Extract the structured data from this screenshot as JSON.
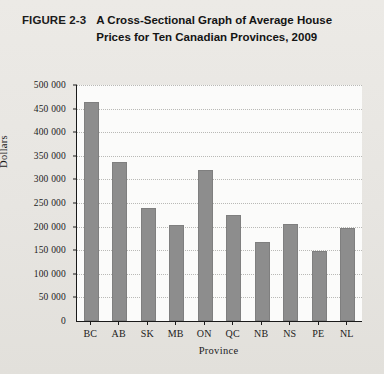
{
  "figure": {
    "label": "FIGURE 2-3",
    "title": "A Cross-Sectional Graph of Average House Prices for Ten Canadian Provinces, 2009"
  },
  "colors": {
    "bar_fill": "#8d8d8d",
    "axis_line": "#1a1a1a",
    "gridline": "#b9b9b6",
    "plot_background": "#fbfbfa",
    "page_background": "#e8e6e2"
  },
  "chart_data": {
    "type": "bar",
    "title": "A Cross-Sectional Graph of Average House Prices for Ten Canadian Provinces, 2009",
    "xlabel": "Province",
    "ylabel": "Dollars",
    "categories": [
      "BC",
      "AB",
      "SK",
      "MB",
      "ON",
      "QC",
      "NB",
      "NS",
      "PE",
      "NL"
    ],
    "values": [
      465000,
      337000,
      240000,
      203000,
      321000,
      224000,
      167000,
      205000,
      149000,
      198000
    ],
    "ylim": [
      0,
      500000
    ],
    "ytick_values": [
      0,
      50000,
      100000,
      150000,
      200000,
      250000,
      300000,
      350000,
      400000,
      450000,
      500000
    ],
    "ytick_labels": [
      "0",
      "50 000",
      "100 000",
      "150 000",
      "200 000",
      "250 000",
      "300 000",
      "350 000",
      "400 000",
      "450 000",
      "500 000"
    ],
    "grid": true,
    "grid_axis": "y",
    "legend": null,
    "legend_position": "none"
  }
}
